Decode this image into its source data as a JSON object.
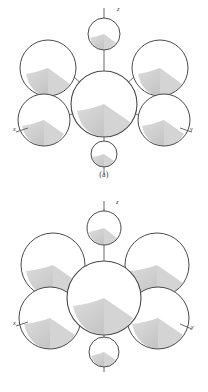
{
  "document": {
    "kind": "crystal-structure-figure-pair",
    "background_color": "#ffffff",
    "ink_color": "#4a4a4a",
    "shade_color": "#d2d2d2",
    "shade_color_dark": "#c4c4c4"
  },
  "figures": [
    {
      "id": "a",
      "caption": "(a)",
      "axes": [
        {
          "name": "z-axis",
          "label": "z",
          "label_x": 117,
          "label_y": 11
        },
        {
          "name": "x-axis",
          "label": "x",
          "label_x": 13,
          "label_y": 131
        },
        {
          "name": "y-axis",
          "label": "y",
          "label_x": 190,
          "label_y": 131
        }
      ],
      "atoms": [
        {
          "name": "center-atom",
          "cx": 104,
          "cy": 104,
          "r": 33
        },
        {
          "name": "top-small-atom",
          "cx": 104,
          "cy": 34,
          "r": 16
        },
        {
          "name": "bottom-small-atom",
          "cx": 104,
          "cy": 154,
          "r": 13
        },
        {
          "name": "upper-left-atom",
          "cx": 48,
          "cy": 68,
          "r": 28
        },
        {
          "name": "upper-right-atom",
          "cx": 160,
          "cy": 68,
          "r": 28
        },
        {
          "name": "lower-left-atom",
          "cx": 44,
          "cy": 120,
          "r": 26
        },
        {
          "name": "lower-right-atom",
          "cx": 164,
          "cy": 120,
          "r": 26
        }
      ]
    },
    {
      "id": "b",
      "caption": "(b)",
      "axes": [
        {
          "name": "z-axis",
          "label": "z",
          "label_x": 116,
          "label_y": 14
        },
        {
          "name": "x-axis",
          "label": "x",
          "label_x": 13,
          "label_y": 135
        },
        {
          "name": "y-axis",
          "label": "y",
          "label_x": 191,
          "label_y": 139
        }
      ],
      "atoms": [
        {
          "name": "center-atom",
          "cx": 104,
          "cy": 108,
          "r": 37
        },
        {
          "name": "top-small-atom",
          "cx": 104,
          "cy": 38,
          "r": 17
        },
        {
          "name": "bottom-small-atom",
          "cx": 104,
          "cy": 162,
          "r": 15
        },
        {
          "name": "upper-left-atom",
          "cx": 53,
          "cy": 75,
          "r": 32
        },
        {
          "name": "upper-right-atom",
          "cx": 157,
          "cy": 75,
          "r": 32
        },
        {
          "name": "lower-left-atom",
          "cx": 50,
          "cy": 128,
          "r": 31
        },
        {
          "name": "lower-right-atom",
          "cx": 158,
          "cy": 128,
          "r": 31
        }
      ]
    }
  ]
}
